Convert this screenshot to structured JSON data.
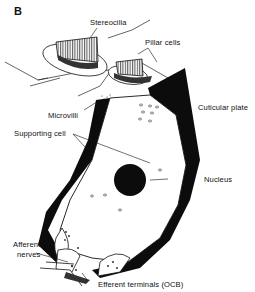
{
  "figure": {
    "panel_label": "B"
  },
  "labels": {
    "stereocilia": "Stereocilia",
    "pillar_cells": "Pillar cells",
    "microvilli": "Microvilli",
    "cuticular_plate": "Cuticular plate",
    "supporting_cell": "Supporting cell",
    "nucleus": "Nucleus",
    "afferent_nerves_line1": "Afferent",
    "afferent_nerves_line2": "nerves",
    "efferent_terminals": "Efferent terminals (OCB)"
  },
  "colors": {
    "ink": "#111111",
    "background": "#ffffff"
  }
}
